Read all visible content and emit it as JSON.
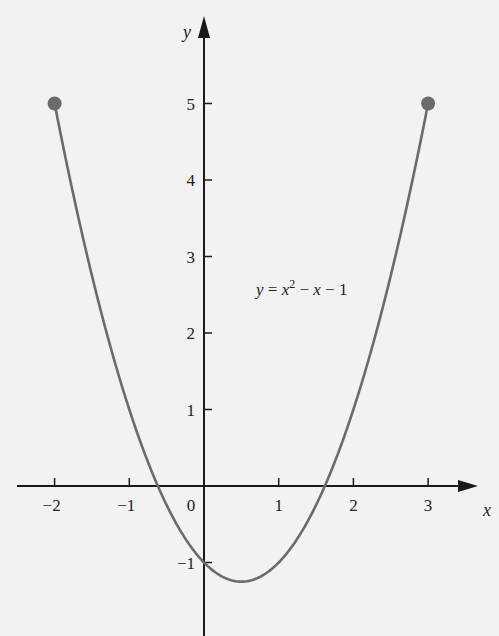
{
  "chart_data": {
    "type": "line",
    "title": "",
    "function": "y = x^2 - x - 1",
    "annotation": {
      "text_y": "y",
      "text_eq": "= x",
      "text_exp": "2",
      "text_rest": " − x − 1",
      "x": 2.4,
      "y": 2.6
    },
    "xlabel": "x",
    "ylabel": "y",
    "xlim": [
      -2.5,
      3.7
    ],
    "ylim": [
      -1.95,
      5.6
    ],
    "domain": [
      -2,
      3
    ],
    "x_ticks": [
      -2,
      -1,
      0,
      1,
      2,
      3
    ],
    "x_tick_labels": [
      "−2",
      "−1",
      "0",
      "1",
      "2",
      "3"
    ],
    "y_ticks": [
      1,
      2,
      3,
      4,
      5,
      -1
    ],
    "y_tick_labels": [
      "1",
      "2",
      "3",
      "4",
      "5",
      "−1"
    ],
    "endpoints": [
      {
        "x": -2,
        "y": 5,
        "style": "closed"
      },
      {
        "x": 3,
        "y": 5,
        "style": "closed"
      }
    ],
    "vertex": {
      "x": 0.5,
      "y": -1.25
    },
    "roots": [
      -0.618,
      1.618
    ],
    "x": [
      -2,
      -1.5,
      -1,
      -0.5,
      0,
      0.5,
      1,
      1.5,
      2,
      2.5,
      3
    ],
    "series": [
      {
        "name": "y = x^2 - x - 1",
        "values": [
          5,
          2.75,
          1,
          -0.25,
          -1,
          -1.25,
          -1,
          -0.25,
          1,
          2.75,
          5
        ]
      }
    ],
    "grid": false,
    "legend": "none",
    "colors": {
      "curve": "#6b6b6b",
      "axes": "#1a1a1a",
      "background": "#f2f2f2",
      "points": "#6b6b6b"
    }
  }
}
